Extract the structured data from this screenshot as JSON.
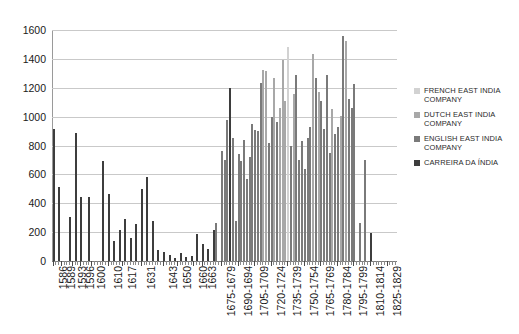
{
  "chart_data": {
    "type": "bar",
    "title": "",
    "xlabel": "",
    "ylabel": "",
    "ylim": [
      0,
      1600
    ],
    "ytick_step": 200,
    "yticks": [
      0,
      200,
      400,
      600,
      800,
      1000,
      1200,
      1400,
      1600
    ],
    "grid": true,
    "legend_position": "right",
    "legend": [
      {
        "name": "FRENCH EAST INDIA COMPANY",
        "color": "#d2d2d2"
      },
      {
        "name": "DUTCH EAST INDIA COMPANY",
        "color": "#a8a8a8"
      },
      {
        "name": "ENGLISH EAST INDIA COMPANY",
        "color": "#7a7a7a"
      },
      {
        "name": "CARREIRA DA ÍNDIA",
        "color": "#3d3d3d"
      }
    ],
    "xtick_labels": [
      "1586",
      "1589",
      "1593",
      "1596",
      "1600",
      "1610",
      "1617",
      "1631",
      "1643",
      "1650",
      "1660",
      "1663",
      "1675-1679",
      "1690-1694",
      "1705-1709",
      "1720-1724",
      "1735-1739",
      "1750-1754",
      "1765-1769",
      "1780-1784",
      "1795-1799",
      "1810-1814",
      "1825-1829"
    ],
    "xtick_positions": [
      0,
      3,
      7,
      10,
      14,
      20,
      25,
      32,
      40,
      45,
      51,
      54,
      61,
      67,
      73,
      79,
      85,
      91,
      97,
      103,
      109,
      115,
      121
    ],
    "n_slots": 125,
    "bars": [
      {
        "i": 0,
        "v": 915,
        "s": 3
      },
      {
        "i": 2,
        "v": 510,
        "s": 3
      },
      {
        "i": 6,
        "v": 305,
        "s": 3
      },
      {
        "i": 8,
        "v": 885,
        "s": 3
      },
      {
        "i": 10,
        "v": 440,
        "s": 3
      },
      {
        "i": 13,
        "v": 440,
        "s": 3
      },
      {
        "i": 18,
        "v": 695,
        "s": 3
      },
      {
        "i": 20,
        "v": 465,
        "s": 3
      },
      {
        "i": 22,
        "v": 140,
        "s": 3
      },
      {
        "i": 24,
        "v": 215,
        "s": 3
      },
      {
        "i": 26,
        "v": 290,
        "s": 3
      },
      {
        "i": 28,
        "v": 160,
        "s": 3
      },
      {
        "i": 30,
        "v": 255,
        "s": 3
      },
      {
        "i": 32,
        "v": 500,
        "s": 3
      },
      {
        "i": 34,
        "v": 580,
        "s": 3
      },
      {
        "i": 36,
        "v": 280,
        "s": 3
      },
      {
        "i": 38,
        "v": 75,
        "s": 3
      },
      {
        "i": 40,
        "v": 60,
        "s": 3
      },
      {
        "i": 42,
        "v": 45,
        "s": 3
      },
      {
        "i": 44,
        "v": 20,
        "s": 3
      },
      {
        "i": 46,
        "v": 55,
        "s": 3
      },
      {
        "i": 48,
        "v": 25,
        "s": 3
      },
      {
        "i": 50,
        "v": 35,
        "s": 3
      },
      {
        "i": 52,
        "v": 185,
        "s": 3
      },
      {
        "i": 54,
        "v": 115,
        "s": 3
      },
      {
        "i": 56,
        "v": 85,
        "s": 3
      },
      {
        "i": 58,
        "v": 215,
        "s": 3
      },
      {
        "i": 59,
        "v": 265,
        "s": 2
      },
      {
        "i": 61,
        "v": 760,
        "s": 2
      },
      {
        "i": 62,
        "v": 700,
        "s": 2
      },
      {
        "i": 63,
        "v": 980,
        "s": 2
      },
      {
        "i": 64,
        "v": 1195,
        "s": 3
      },
      {
        "i": 65,
        "v": 855,
        "s": 2
      },
      {
        "i": 66,
        "v": 280,
        "s": 2
      },
      {
        "i": 67,
        "v": 740,
        "s": 2
      },
      {
        "i": 68,
        "v": 695,
        "s": 2
      },
      {
        "i": 69,
        "v": 835,
        "s": 2
      },
      {
        "i": 70,
        "v": 570,
        "s": 2
      },
      {
        "i": 71,
        "v": 720,
        "s": 2
      },
      {
        "i": 72,
        "v": 950,
        "s": 2
      },
      {
        "i": 73,
        "v": 905,
        "s": 2
      },
      {
        "i": 74,
        "v": 900,
        "s": 2
      },
      {
        "i": 75,
        "v": 1235,
        "s": 2
      },
      {
        "i": 76,
        "v": 1320,
        "s": 1
      },
      {
        "i": 77,
        "v": 1315,
        "s": 1
      },
      {
        "i": 78,
        "v": 820,
        "s": 2
      },
      {
        "i": 79,
        "v": 1000,
        "s": 2
      },
      {
        "i": 80,
        "v": 1265,
        "s": 1
      },
      {
        "i": 81,
        "v": 965,
        "s": 2
      },
      {
        "i": 82,
        "v": 1060,
        "s": 1
      },
      {
        "i": 83,
        "v": 1390,
        "s": 1
      },
      {
        "i": 84,
        "v": 1110,
        "s": 1
      },
      {
        "i": 85,
        "v": 1480,
        "s": 0
      },
      {
        "i": 86,
        "v": 800,
        "s": 2
      },
      {
        "i": 87,
        "v": 1160,
        "s": 1
      },
      {
        "i": 88,
        "v": 1290,
        "s": 2
      },
      {
        "i": 89,
        "v": 700,
        "s": 2
      },
      {
        "i": 90,
        "v": 830,
        "s": 2
      },
      {
        "i": 91,
        "v": 640,
        "s": 2
      },
      {
        "i": 92,
        "v": 855,
        "s": 2
      },
      {
        "i": 93,
        "v": 925,
        "s": 2
      },
      {
        "i": 94,
        "v": 1435,
        "s": 1
      },
      {
        "i": 95,
        "v": 1265,
        "s": 2
      },
      {
        "i": 96,
        "v": 1170,
        "s": 1
      },
      {
        "i": 97,
        "v": 1110,
        "s": 2
      },
      {
        "i": 98,
        "v": 915,
        "s": 2
      },
      {
        "i": 99,
        "v": 1290,
        "s": 2
      },
      {
        "i": 100,
        "v": 745,
        "s": 2
      },
      {
        "i": 101,
        "v": 1055,
        "s": 1
      },
      {
        "i": 102,
        "v": 880,
        "s": 2
      },
      {
        "i": 103,
        "v": 925,
        "s": 2
      },
      {
        "i": 104,
        "v": 1005,
        "s": 1
      },
      {
        "i": 105,
        "v": 1560,
        "s": 2
      },
      {
        "i": 106,
        "v": 1525,
        "s": 1
      },
      {
        "i": 107,
        "v": 1120,
        "s": 2
      },
      {
        "i": 108,
        "v": 1060,
        "s": 2
      },
      {
        "i": 109,
        "v": 1225,
        "s": 2
      },
      {
        "i": 111,
        "v": 265,
        "s": 2
      },
      {
        "i": 113,
        "v": 700,
        "s": 2
      },
      {
        "i": 115,
        "v": 195,
        "s": 3
      }
    ]
  }
}
